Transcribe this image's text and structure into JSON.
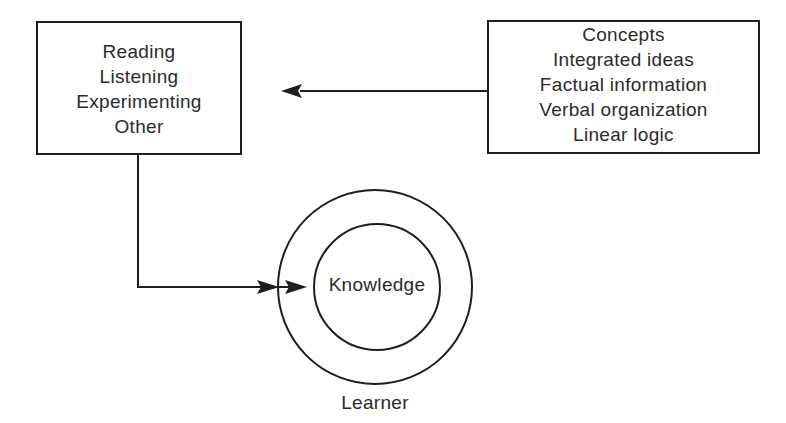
{
  "diagram": {
    "type": "flow-diagram",
    "input_methods_box": {
      "items": [
        "Reading",
        "Listening",
        "Experimenting",
        "Other"
      ]
    },
    "content_box": {
      "items": [
        "Concepts",
        "Integrated ideas",
        "Factual information",
        "Verbal organization",
        "Linear logic"
      ]
    },
    "learner_circle": {
      "outer_label": "Learner",
      "inner_label": "Knowledge"
    },
    "connectors": [
      {
        "from": "content_box",
        "to": "input_methods_box",
        "direction": "left"
      },
      {
        "from": "input_methods_box",
        "to": "learner_circle",
        "direction": "down-then-right",
        "arrowheads": 2
      }
    ],
    "colors": {
      "line": "#1e1e1e",
      "text": "#2b2b2b",
      "background": "#ffffff"
    }
  }
}
